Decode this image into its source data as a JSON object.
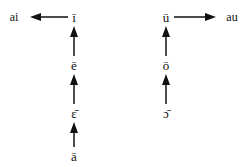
{
  "figure": {
    "background_color": "#ffffff",
    "ink_color": "#111111",
    "width": 248,
    "height": 167
  },
  "chart_data": {
    "type": "diagram",
    "title": "",
    "subtitle": "",
    "xlabel": "",
    "ylabel": "",
    "grid": false,
    "legend": null,
    "nodes": [
      {
        "id": "long-i",
        "label": "ī",
        "column": "left",
        "x": 74,
        "y": 17
      },
      {
        "id": "long-e",
        "label": "ē",
        "column": "left",
        "x": 74,
        "y": 65
      },
      {
        "id": "long-open-e",
        "label": "ɛ̄",
        "column": "left",
        "x": 74,
        "y": 113
      },
      {
        "id": "long-a",
        "label": "ā",
        "column": "left",
        "x": 74,
        "y": 156
      },
      {
        "id": "ai",
        "label": "ai",
        "column": "left-out",
        "x": 14,
        "y": 17
      },
      {
        "id": "long-u",
        "label": "ū",
        "column": "right",
        "x": 166,
        "y": 17
      },
      {
        "id": "long-o",
        "label": "ō",
        "column": "right",
        "x": 166,
        "y": 65
      },
      {
        "id": "long-open-o",
        "label": "ɔ̄",
        "column": "right",
        "x": 166,
        "y": 113
      },
      {
        "id": "au",
        "label": "au",
        "column": "right-out",
        "x": 232,
        "y": 17
      }
    ],
    "arrows": [
      {
        "id": "arrow-i-to-ai",
        "from": "long-i",
        "to": "ai",
        "direction": "left",
        "x1": 68,
        "y1": 17,
        "x2": 30,
        "y2": 17
      },
      {
        "id": "arrow-e-to-i",
        "from": "long-e",
        "to": "long-i",
        "direction": "up",
        "x1": 74,
        "y1": 56,
        "x2": 74,
        "y2": 26
      },
      {
        "id": "arrow-open-e-to-e",
        "from": "long-open-e",
        "to": "long-e",
        "direction": "up",
        "x1": 74,
        "y1": 104,
        "x2": 74,
        "y2": 74
      },
      {
        "id": "arrow-a-to-open-e",
        "from": "long-a",
        "to": "long-open-e",
        "direction": "up",
        "x1": 74,
        "y1": 147,
        "x2": 74,
        "y2": 122
      },
      {
        "id": "arrow-u-to-au",
        "from": "long-u",
        "to": "au",
        "direction": "right",
        "x1": 174,
        "y1": 17,
        "x2": 216,
        "y2": 17
      },
      {
        "id": "arrow-o-to-u",
        "from": "long-o",
        "to": "long-u",
        "direction": "up",
        "x1": 166,
        "y1": 56,
        "x2": 166,
        "y2": 26
      },
      {
        "id": "arrow-open-o-to-o",
        "from": "long-open-o",
        "to": "long-o",
        "direction": "up",
        "x1": 166,
        "y1": 104,
        "x2": 166,
        "y2": 74
      }
    ]
  }
}
